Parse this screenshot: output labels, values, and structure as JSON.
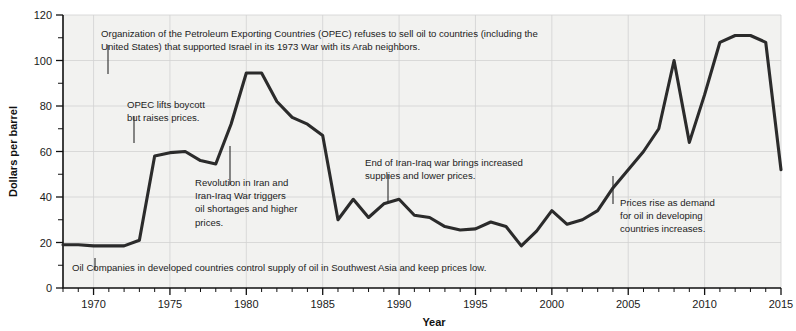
{
  "chart_data": {
    "type": "line",
    "title": "",
    "xlabel": "Year",
    "ylabel": "Dollars per barrel",
    "xlim": [
      1968,
      2015
    ],
    "ylim": [
      0,
      120
    ],
    "grid": true,
    "legend_position": "none",
    "y_ticks": [
      0,
      20,
      40,
      60,
      80,
      100,
      120
    ],
    "y_tick_labels": [
      "0",
      "20",
      "40",
      "60",
      "80",
      "100",
      "120"
    ],
    "y_minor_ticks": [
      10,
      30,
      50,
      70,
      90,
      110
    ],
    "x_ticks": [
      1970,
      1975,
      1980,
      1985,
      1990,
      1995,
      2000,
      2005,
      2010,
      2015
    ],
    "x_tick_labels": [
      "1970",
      "1975",
      "1980",
      "1985",
      "1990",
      "1995",
      "2000",
      "2005",
      "2010",
      "2015"
    ],
    "series": [
      {
        "name": "Oil price (dollars per barrel)",
        "color": "#2b2b2b",
        "x": [
          1968,
          1969,
          1970,
          1971,
          1972,
          1973,
          1974,
          1975,
          1976,
          1977,
          1978,
          1979,
          1980,
          1981,
          1982,
          1983,
          1984,
          1985,
          1986,
          1987,
          1988,
          1989,
          1990,
          1991,
          1992,
          1993,
          1994,
          1995,
          1996,
          1997,
          1998,
          1999,
          2000,
          2001,
          2002,
          2003,
          2004,
          2005,
          2006,
          2007,
          2008,
          2009,
          2010,
          2011,
          2012,
          2013,
          2014,
          2015
        ],
        "y": [
          19,
          19,
          18.5,
          18.5,
          18.5,
          21,
          58,
          59.5,
          60,
          56,
          54.5,
          72,
          94.5,
          94.5,
          82,
          75,
          72,
          67,
          30,
          39,
          31,
          37,
          39,
          32,
          31,
          27,
          25.5,
          26,
          29,
          27,
          18.5,
          25,
          34,
          28,
          30,
          34,
          44,
          52,
          60,
          70,
          100,
          64,
          85,
          108,
          111,
          111,
          108,
          52
        ]
      }
    ],
    "annotations": [
      {
        "id": "opec-embargo",
        "lines": [
          "Organization of the Petroleum Exporting Countries (OPEC) refuses to sell oil to countries (including the",
          "United States) that supported Israel in its 1973 War with its Arab neighbors."
        ],
        "text_x": 101,
        "text_y": 37,
        "leader": {
          "x": 108,
          "y1": 45,
          "y2": 74
        }
      },
      {
        "id": "opec-lifts-boycott",
        "lines": [
          "OPEC lifts boycott",
          "but raises prices."
        ],
        "text_x": 127,
        "text_y": 108,
        "leader": {
          "x": 134,
          "y1": 116,
          "y2": 143
        }
      },
      {
        "id": "iran-revolution",
        "lines": [
          "Revolution in Iran and",
          "Iran-Iraq War triggers",
          "oil shortages and higher",
          "prices."
        ],
        "text_x": 195,
        "text_y": 186,
        "leader": {
          "x": 230,
          "y1": 185,
          "y2": 146
        }
      },
      {
        "id": "end-iran-iraq-war",
        "lines": [
          "End of Iran-Iraq war brings increased",
          "supplies and lower prices."
        ],
        "text_x": 365,
        "text_y": 166,
        "leader": {
          "x": 388,
          "y1": 174,
          "y2": 202
        }
      },
      {
        "id": "developing-demand",
        "lines": [
          "Prices rise as demand",
          "for oil in developing",
          "countries increases."
        ],
        "text_x": 620,
        "text_y": 206,
        "leader": {
          "x": 613,
          "y1": 204,
          "y2": 176
        }
      },
      {
        "id": "oil-companies-control",
        "lines": [
          "Oil Companies in developed countries control supply of oil in Southwest Asia and keep prices low."
        ],
        "text_x": 72,
        "text_y": 271,
        "leader": {
          "x": 95,
          "y1": 258,
          "y2": 270
        }
      }
    ]
  },
  "colors": {
    "line": "#2b2b2b",
    "grid": "#d2d2d2",
    "axis": "#111111",
    "plot_background": "#f2f2f0",
    "page_background": "#ffffff",
    "text": "#1a1a1a"
  }
}
